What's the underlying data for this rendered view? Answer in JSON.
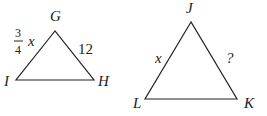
{
  "triangles": [
    {
      "name": "GHI",
      "vertices": {
        "top": "G",
        "left": "I",
        "right": "H"
      },
      "sides": {
        "left_side": {
          "numerator": "3",
          "denominator": "4",
          "variable": "x"
        },
        "right_side": "12"
      }
    },
    {
      "name": "JKL",
      "vertices": {
        "top": "J",
        "left": "L",
        "right": "K"
      },
      "sides": {
        "left_side": "x",
        "right_side": "?"
      }
    }
  ],
  "colors": {
    "stroke": "#222222",
    "background": "#ffffff"
  }
}
